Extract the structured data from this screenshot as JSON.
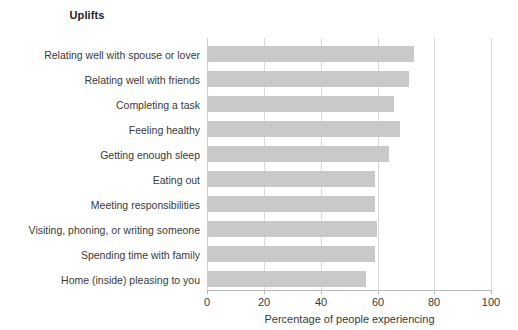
{
  "chart_data": {
    "type": "bar",
    "orientation": "horizontal",
    "title": "Uplifts",
    "xlabel": "Percentage of people experiencing",
    "ylabel": "",
    "xlim": [
      0,
      100
    ],
    "xticks": [
      0,
      20,
      40,
      60,
      80,
      100
    ],
    "xtick_labels": [
      "0",
      "20",
      "40",
      "60",
      "80",
      "100"
    ],
    "grid": true,
    "grid_axis": "x",
    "legend": false,
    "bar_color": "#c9c9c9",
    "text_color": "#3a3a3a",
    "title_color": "#222222",
    "gridline_color": "#d9d9d9",
    "categories": [
      "Relating well with spouse or lover",
      "Relating well with friends",
      "Completing a task",
      "Feeling healthy",
      "Getting enough sleep",
      "Eating out",
      "Meeting responsibilities",
      "Visiting, phoning, or writing someone",
      "Spending time with family",
      "Home (inside) pleasing to you"
    ],
    "values": [
      73,
      71,
      66,
      68,
      64,
      59,
      59,
      60,
      59,
      56
    ]
  }
}
